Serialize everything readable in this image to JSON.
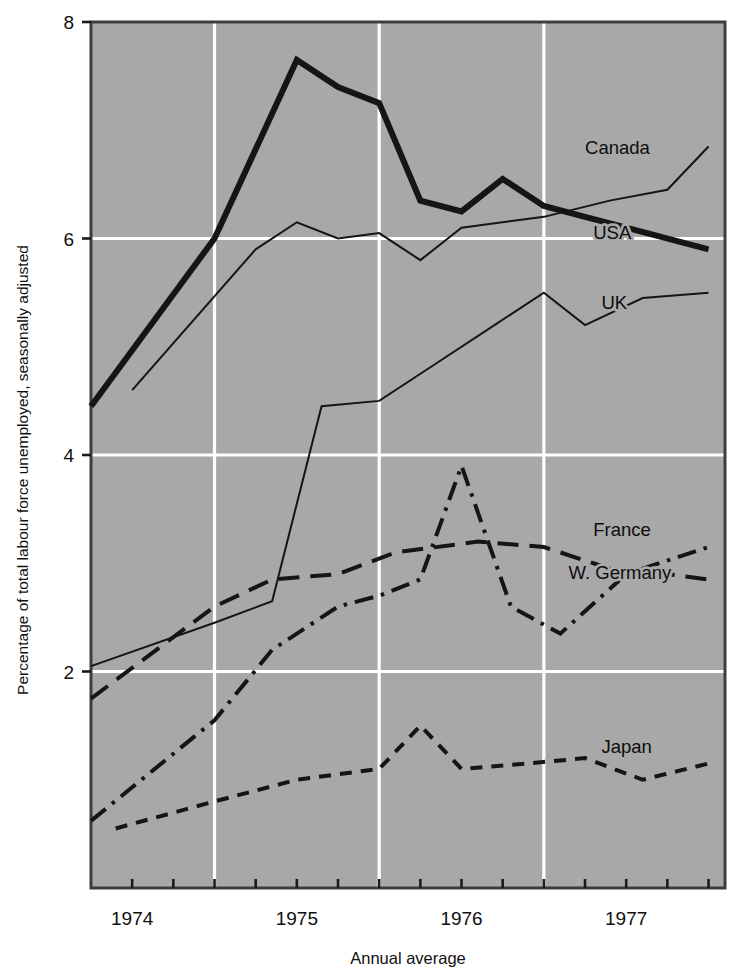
{
  "figure": {
    "background_color": "#ffffff",
    "plot_background_color": "#a8a8a8",
    "gridline_color": "#ffffff",
    "axis_color": "#3d3d3d",
    "line_color": "#151515"
  },
  "axes": {
    "y_axis_title": "Percentage of total labour force unemployed, seasonally adjusted",
    "x_axis_title": "Annual average",
    "y_ticks": [
      "8",
      "6",
      "4",
      "2"
    ],
    "x_ticks": [
      "1974",
      "1975",
      "1976",
      "1977"
    ]
  },
  "chart_data": {
    "type": "line",
    "title": "",
    "subtitle": "",
    "xlabel": "Annual average",
    "ylabel": "Percentage of total labour force unemployed, seasonally adjusted",
    "xlim": [
      1973.75,
      1977.6
    ],
    "ylim": [
      0,
      8
    ],
    "yticks": [
      2,
      4,
      6,
      8
    ],
    "xticks": [
      1974,
      1975,
      1976,
      1977
    ],
    "x_tick_positions_are_year_midpoints": true,
    "gridlines": {
      "vertical_at": [
        1974.5,
        1975.5,
        1976.5
      ],
      "horizontal_at": [
        2,
        4,
        6
      ],
      "color": "#ffffff"
    },
    "legend": {
      "position": "inline-right-of-line-ends",
      "entries": [
        "Canada",
        "USA",
        "UK",
        "France",
        "W. Germany",
        "Japan"
      ]
    },
    "series": [
      {
        "name": "Canada",
        "style": "solid",
        "line_width": 6,
        "label_position": {
          "x": 1976.75,
          "y": 6.78
        },
        "x": [
          1973.75,
          1974.5,
          1975.0,
          1975.25,
          1975.5,
          1975.75,
          1976.0,
          1976.25,
          1976.5,
          1976.75,
          1977.0,
          1977.5
        ],
        "y": [
          4.45,
          6.0,
          7.65,
          7.4,
          7.25,
          6.35,
          6.25,
          6.55,
          6.3,
          6.2,
          6.1,
          5.9
        ]
      },
      {
        "name": "USA",
        "style": "solid",
        "line_width": 2,
        "label_position": {
          "x": 1976.8,
          "y": 6.0
        },
        "x": [
          1974.0,
          1974.75,
          1975.0,
          1975.25,
          1975.5,
          1975.75,
          1976.0,
          1976.5,
          1976.9,
          1977.25,
          1977.5
        ],
        "y": [
          4.6,
          5.9,
          6.15,
          6.0,
          6.05,
          5.8,
          6.1,
          6.2,
          6.35,
          6.45,
          6.85
        ]
      },
      {
        "name": "UK",
        "style": "solid",
        "line_width": 2,
        "label_position": {
          "x": 1976.85,
          "y": 5.35
        },
        "x": [
          1973.75,
          1974.5,
          1974.85,
          1975.15,
          1975.5,
          1975.85,
          1976.2,
          1976.5,
          1976.75,
          1977.1,
          1977.5
        ],
        "y": [
          2.05,
          2.45,
          2.65,
          4.45,
          4.5,
          4.85,
          5.2,
          5.5,
          5.2,
          5.45,
          5.5
        ]
      },
      {
        "name": "France",
        "style": "long-dash",
        "line_width": 4,
        "label_position": {
          "x": 1976.8,
          "y": 3.25
        },
        "x": [
          1973.75,
          1974.5,
          1974.85,
          1975.25,
          1975.6,
          1976.1,
          1976.5,
          1976.9,
          1977.25,
          1977.5
        ],
        "y": [
          1.75,
          2.6,
          2.85,
          2.9,
          3.1,
          3.2,
          3.15,
          2.95,
          2.9,
          2.85
        ]
      },
      {
        "name": "W. Germany",
        "style": "dash-dot",
        "line_width": 4,
        "label_position": {
          "x": 1976.65,
          "y": 2.85
        },
        "x": [
          1973.75,
          1974.5,
          1974.85,
          1975.25,
          1975.5,
          1975.75,
          1976.0,
          1976.3,
          1976.6,
          1977.0,
          1977.5
        ],
        "y": [
          0.62,
          1.55,
          2.2,
          2.6,
          2.7,
          2.85,
          3.9,
          2.6,
          2.35,
          2.9,
          3.15
        ]
      },
      {
        "name": "Japan",
        "style": "short-dash",
        "line_width": 4,
        "label_position": {
          "x": 1976.85,
          "y": 1.25
        },
        "x": [
          1973.9,
          1974.5,
          1975.0,
          1975.5,
          1975.75,
          1976.0,
          1976.4,
          1976.75,
          1977.1,
          1977.5
        ],
        "y": [
          0.55,
          0.8,
          1.0,
          1.1,
          1.5,
          1.1,
          1.15,
          1.2,
          1.0,
          1.15
        ]
      }
    ]
  }
}
